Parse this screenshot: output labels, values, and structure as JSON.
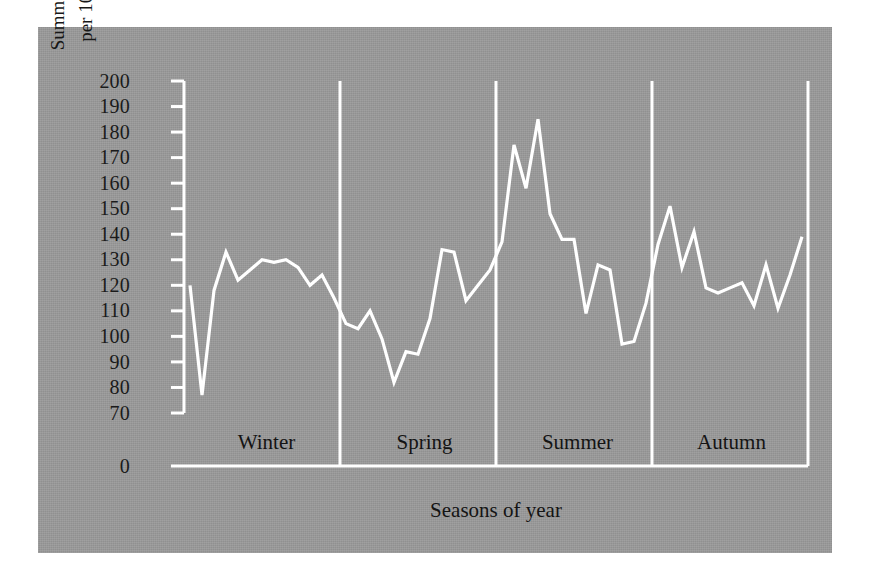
{
  "figure": {
    "panel_color": "#9a9a9a",
    "line_color": "#ffffff",
    "axis_color": "#ffffff",
    "text_color": "#141414"
  },
  "chart_data": {
    "type": "line",
    "title": "",
    "xlabel": "Seasons of year",
    "ylabel_line1": "Summed weekly attack rate",
    "ylabel_line2": "per 100 000 (1976–1983)",
    "ylim": [
      70,
      200
    ],
    "y_baseline_tick": "0",
    "yticks": [
      70,
      80,
      90,
      100,
      110,
      120,
      130,
      140,
      150,
      160,
      170,
      180,
      190,
      200
    ],
    "ytick_labels": [
      "70",
      "80",
      "90",
      "100",
      "110",
      "120",
      "130",
      "140",
      "150",
      "160",
      "170",
      "180",
      "190",
      "200"
    ],
    "axis_break": true,
    "grid": false,
    "legend": null,
    "categories": [
      "Winter",
      "Spring",
      "Summer",
      "Autumn"
    ],
    "series": [
      {
        "name": "Summed weekly attack rate per 100 000 (1976-1983)",
        "x": [
          1,
          2,
          3,
          4,
          5,
          6,
          7,
          8,
          9,
          10,
          11,
          12,
          13,
          14,
          15,
          16,
          17,
          18,
          19,
          20,
          21,
          22,
          23,
          24,
          25,
          26,
          27,
          28,
          29,
          30,
          31,
          32,
          33,
          34,
          35,
          36,
          37,
          38,
          39,
          40,
          41,
          42,
          43,
          44,
          45,
          46,
          47,
          48,
          49,
          50,
          51,
          52
        ],
        "values": [
          120,
          77,
          118,
          133,
          122,
          126,
          130,
          129,
          130,
          127,
          120,
          124,
          115,
          105,
          103,
          110,
          99,
          82,
          94,
          93,
          107,
          134,
          133,
          114,
          120,
          126,
          137,
          175,
          158,
          185,
          148,
          138,
          138,
          109,
          128,
          126,
          97,
          98,
          113,
          136,
          151,
          127,
          141,
          119,
          117,
          119,
          121,
          112,
          128,
          111,
          124,
          139
        ]
      }
    ],
    "season_segments": [
      {
        "label": "Winter",
        "start_index": 1,
        "end_index": 13,
        "values": [
          120,
          77,
          118,
          133,
          122,
          126,
          130,
          129,
          130,
          127,
          120,
          124,
          115
        ]
      },
      {
        "label": "Spring",
        "start_index": 14,
        "end_index": 26,
        "values": [
          105,
          103,
          110,
          99,
          82,
          94,
          93,
          107,
          134,
          133,
          114,
          120,
          126
        ]
      },
      {
        "label": "Summer",
        "start_index": 27,
        "end_index": 39,
        "values": [
          137,
          175,
          158,
          185,
          148,
          138,
          138,
          109,
          128,
          126,
          97,
          98,
          113
        ]
      },
      {
        "label": "Autumn",
        "start_index": 40,
        "end_index": 52,
        "values": [
          136,
          151,
          127,
          141,
          119,
          117,
          119,
          121,
          112,
          128,
          111,
          124,
          139
        ]
      }
    ],
    "annotations": {
      "minimum": {
        "value": 77,
        "season": "Winter"
      },
      "maximum": {
        "value": 185,
        "season": "Summer"
      }
    }
  }
}
